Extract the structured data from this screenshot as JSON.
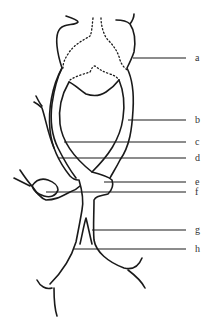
{
  "diagram": {
    "type": "anatomical line drawing",
    "colors": {
      "line": "#1a1a1a",
      "label": "#333333",
      "background": "#ffffff"
    },
    "labels": [
      {
        "id": "a",
        "text": "a",
        "y": 58
      },
      {
        "id": "b",
        "text": "b",
        "y": 120
      },
      {
        "id": "c",
        "text": "c",
        "y": 142
      },
      {
        "id": "d",
        "text": "d",
        "y": 158
      },
      {
        "id": "e",
        "text": "e",
        "y": 182
      },
      {
        "id": "f",
        "text": "f",
        "y": 192
      },
      {
        "id": "g",
        "text": "g",
        "y": 230
      },
      {
        "id": "h",
        "text": "h",
        "y": 249
      }
    ]
  }
}
